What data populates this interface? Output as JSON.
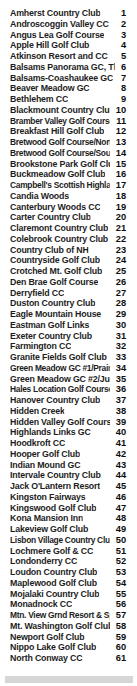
{
  "document": {
    "type": "index-list",
    "background_color": "#ffffff",
    "text_color": "#1d1d1d",
    "footer_band_color": "#d6d6d6"
  },
  "list": {
    "items": [
      {
        "name": "Amherst Country Club",
        "number": "1"
      },
      {
        "name": "Androscoggin Valley CC",
        "number": "2"
      },
      {
        "name": "Angus Lea Golf Course",
        "number": "3"
      },
      {
        "name": "Apple Hill Golf Club",
        "number": "4"
      },
      {
        "name": "Atkinson Resort and CC",
        "number": "5"
      },
      {
        "name": "Balsams Panorama GC, The",
        "number": "6"
      },
      {
        "name": "Balsams-Coashaukee GC",
        "number": "7"
      },
      {
        "name": "Beaver Meadow GC",
        "number": "8"
      },
      {
        "name": "Bethlehem CC",
        "number": "9"
      },
      {
        "name": "Blackmount Country Club",
        "number": "10"
      },
      {
        "name": "Bramber Valley Golf Course",
        "number": "11"
      },
      {
        "name": "Breakfast Hill Golf Club",
        "number": "12"
      },
      {
        "name": "Bretwood Golf Course/North",
        "number": "13"
      },
      {
        "name": "Bretwood Golf Course/South",
        "number": "14"
      },
      {
        "name": "Brookstone Park Golf Club",
        "number": "15"
      },
      {
        "name": "Buckmeadow Golf Club",
        "number": "16"
      },
      {
        "name": "Campbell's Scottish Highlands",
        "number": "17"
      },
      {
        "name": "Candia Woods",
        "number": "18"
      },
      {
        "name": "Canterbury Woods CC",
        "number": "19"
      },
      {
        "name": "Carter Country Club",
        "number": "20"
      },
      {
        "name": "Claremont Country Club",
        "number": "21"
      },
      {
        "name": "Colebrook Country Club",
        "number": "22"
      },
      {
        "name": "Country Club of NH",
        "number": "23"
      },
      {
        "name": "Countryside Golf Club",
        "number": "24"
      },
      {
        "name": "Crotched Mt. Golf Club",
        "number": "25"
      },
      {
        "name": "Den Brae Golf Course",
        "number": "26"
      },
      {
        "name": "Derryfield CC",
        "number": "27"
      },
      {
        "name": "Duston Country Club",
        "number": "28"
      },
      {
        "name": "Eagle Mountain House",
        "number": "29"
      },
      {
        "name": "Eastman Golf Links",
        "number": "30"
      },
      {
        "name": "Exeter Country Club",
        "number": "31"
      },
      {
        "name": "Farmington CC",
        "number": "32"
      },
      {
        "name": "Granite Fields Golf Club",
        "number": "33"
      },
      {
        "name": "Green Meadow GC #1/Prairie",
        "number": "34"
      },
      {
        "name": "Green Meadow GC #2/Jungle",
        "number": "35"
      },
      {
        "name": "Hales Location Golf Course",
        "number": "36"
      },
      {
        "name": "Hanover Country Club",
        "number": "37"
      },
      {
        "name": "Hidden Creek",
        "number": "38"
      },
      {
        "name": "Hidden Valley Golf Course",
        "number": "39"
      },
      {
        "name": "Highlands Links GC",
        "number": "40"
      },
      {
        "name": "Hoodkroft CC",
        "number": "41"
      },
      {
        "name": "Hooper Golf Club",
        "number": "42"
      },
      {
        "name": "Indian Mound GC",
        "number": "43"
      },
      {
        "name": "Intervale Country Club",
        "number": "44"
      },
      {
        "name": "Jack O'Lantern Resort",
        "number": "45"
      },
      {
        "name": "Kingston Fairways",
        "number": "46"
      },
      {
        "name": "Kingswood Golf Club",
        "number": "47"
      },
      {
        "name": "Kona Mansion Inn",
        "number": "48"
      },
      {
        "name": "Lakeview Golf Club",
        "number": "49"
      },
      {
        "name": "Lisbon Village Country Club",
        "number": "50"
      },
      {
        "name": "Lochmere Golf & CC",
        "number": "51"
      },
      {
        "name": "Londonderry CC",
        "number": "52"
      },
      {
        "name": "Loudon Country Club",
        "number": "53"
      },
      {
        "name": "Maplewood Golf Club",
        "number": "54"
      },
      {
        "name": "Mojalaki Country Club",
        "number": "55"
      },
      {
        "name": "Monadnock CC",
        "number": "56"
      },
      {
        "name": "Mtn. View Grnd Resort & Spa",
        "number": "57"
      },
      {
        "name": "Mt. Washington Golf Club",
        "number": "58"
      },
      {
        "name": "Newport Golf Club",
        "number": "59"
      },
      {
        "name": "Nippo Lake Golf Club",
        "number": "60"
      },
      {
        "name": "North Conway CC",
        "number": "61"
      }
    ]
  }
}
